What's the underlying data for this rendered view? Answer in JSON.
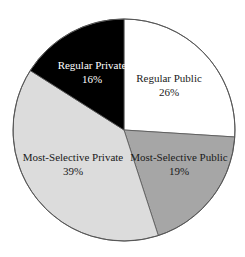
{
  "chart_data": {
    "type": "pie",
    "title": "",
    "start_angle_deg": 0,
    "direction": "clockwise",
    "slices": [
      {
        "label": "Regular Public",
        "value": 26,
        "display": "26%",
        "color": "#ffffff",
        "text_color": "#1a1a1a"
      },
      {
        "label": "Most-Selective Public",
        "value": 19,
        "display": "19%",
        "color": "#a6a6a6",
        "text_color": "#1a1a1a"
      },
      {
        "label": "Most-Selective Private",
        "value": 39,
        "display": "39%",
        "color": "#dcdcdc",
        "text_color": "#1a1a1a"
      },
      {
        "label": "Regular Private",
        "value": 16,
        "display": "16%",
        "color": "#000000",
        "text_color": "#ffffff"
      }
    ],
    "categories": [
      "Regular Public",
      "Most-Selective Public",
      "Most-Selective Private",
      "Regular Private"
    ],
    "values": [
      26,
      19,
      39,
      16
    ],
    "legend": "none (labels inside slices)"
  },
  "layout": {
    "cx": 124,
    "cy": 130,
    "r": 111,
    "label_positions": [
      {
        "x": 169,
        "y": 82
      },
      {
        "x": 179,
        "y": 161
      },
      {
        "x": 73,
        "y": 161
      },
      {
        "x": 92,
        "y": 69
      }
    ]
  }
}
